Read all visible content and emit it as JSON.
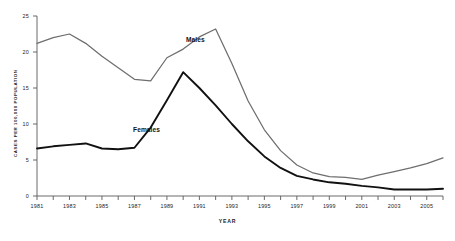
{
  "chart_data": {
    "type": "line",
    "title": "",
    "xlabel": "YEAR",
    "ylabel": "CASES PER 100,000 POPULATION",
    "xlim": [
      1981,
      2006
    ],
    "ylim": [
      0,
      25
    ],
    "grid": false,
    "legend_position": "inline-annotation",
    "x": [
      1981,
      1982,
      1983,
      1984,
      1985,
      1986,
      1987,
      1988,
      1989,
      1990,
      1991,
      1992,
      1993,
      1994,
      1995,
      1996,
      1997,
      1998,
      1999,
      2000,
      2001,
      2002,
      2003,
      2004,
      2005,
      2006
    ],
    "x_tick_labels": [
      "1981",
      "1983",
      "1985",
      "1987",
      "1989",
      "1991",
      "1993",
      "1995",
      "1997",
      "1999",
      "2001",
      "2003",
      "2005"
    ],
    "x_tick_values": [
      1981,
      1983,
      1985,
      1987,
      1989,
      1991,
      1993,
      1995,
      1997,
      1999,
      2001,
      2003,
      2005
    ],
    "y_tick_labels": [
      "0",
      "5",
      "10",
      "15",
      "20",
      "25"
    ],
    "y_tick_values": [
      0,
      5,
      10,
      15,
      20,
      25
    ],
    "series": [
      {
        "name": "Males",
        "color": "#6e6e6e",
        "label": "Males",
        "values": [
          21.2,
          22.0,
          22.5,
          21.2,
          19.4,
          17.8,
          16.2,
          16.0,
          19.2,
          20.4,
          22.1,
          23.2,
          18.4,
          13.2,
          9.2,
          6.3,
          4.3,
          3.2,
          2.7,
          2.6,
          2.3,
          2.9,
          3.4,
          3.9,
          4.5,
          5.3
        ]
      },
      {
        "name": "Females",
        "color": "#111111",
        "label": "Females",
        "values": [
          6.6,
          6.9,
          7.1,
          7.3,
          6.6,
          6.5,
          6.7,
          9.5,
          13.3,
          17.2,
          15.0,
          12.6,
          10.0,
          7.6,
          5.5,
          3.9,
          2.8,
          2.3,
          1.9,
          1.7,
          1.4,
          1.2,
          0.9,
          0.9,
          0.9,
          1.0
        ]
      }
    ]
  }
}
